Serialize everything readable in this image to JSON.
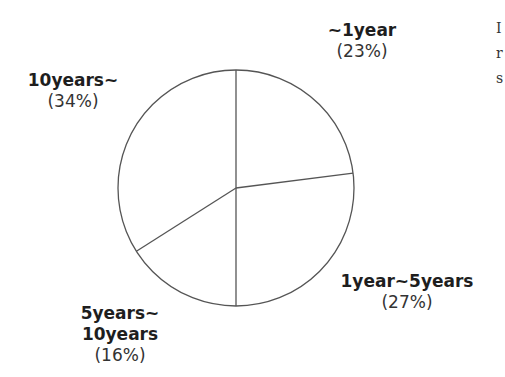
{
  "chart_data": {
    "type": "pie",
    "title": "",
    "start_angle_deg": 0,
    "direction": "clockwise",
    "categories": [
      "~1year",
      "1year~5years",
      "5years~10years",
      "10years~"
    ],
    "values": [
      23,
      27,
      16,
      34
    ],
    "unit": "%",
    "slices": [
      {
        "label": "~1year",
        "label_lines": [
          "~1year"
        ],
        "value": 23,
        "value_text": "(23%)"
      },
      {
        "label": "1year~5years",
        "label_lines": [
          "1year~5years"
        ],
        "value": 27,
        "value_text": "(27%)"
      },
      {
        "label": "5years~10years",
        "label_lines": [
          "5years~",
          "10years"
        ],
        "value": 16,
        "value_text": "(16%)"
      },
      {
        "label": "10years~",
        "label_lines": [
          "10years~"
        ],
        "value": 34,
        "value_text": "(34%)"
      }
    ],
    "legend": "none (labels placed outside slices)",
    "fill_color": "#ffffff",
    "stroke_color": "#555555"
  },
  "labels": {
    "slice0": {
      "line1": "~1year",
      "pct": "(23%)"
    },
    "slice1": {
      "line1": "1year~5years",
      "pct": "(27%)"
    },
    "slice2": {
      "line1": "5years~",
      "line2": "10years",
      "pct": "(16%)"
    },
    "slice3": {
      "line1": "10years~",
      "pct": "(34%)"
    }
  },
  "side_text": {
    "line1": "I",
    "line2": "r",
    "line3": "s"
  }
}
